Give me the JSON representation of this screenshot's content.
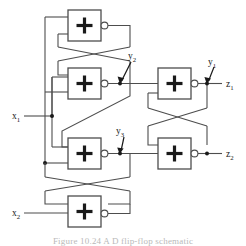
{
  "figure": {
    "type": "logic-circuit-diagram",
    "caption": "Figure 10.24   A D flip-flop schematic",
    "background_color": "#ffffff",
    "wire_color": "#4d4d4d",
    "ink_color": "#1a1a1a"
  },
  "gates": [
    {
      "id": "gate-top-left",
      "symbol": "+",
      "x": 68,
      "y": 10,
      "w": 33,
      "h": 31,
      "inverted_output": true
    },
    {
      "id": "gate-upper-mid-left",
      "symbol": "+",
      "x": 68,
      "y": 68,
      "w": 33,
      "h": 31,
      "inverted_output": true
    },
    {
      "id": "gate-lower-mid-left",
      "symbol": "+",
      "x": 68,
      "y": 138,
      "w": 33,
      "h": 31,
      "inverted_output": true
    },
    {
      "id": "gate-bottom-left",
      "symbol": "+",
      "x": 68,
      "y": 196,
      "w": 33,
      "h": 31,
      "inverted_output": true
    },
    {
      "id": "gate-top-right",
      "symbol": "+",
      "x": 158,
      "y": 68,
      "w": 33,
      "h": 31,
      "inverted_output": true
    },
    {
      "id": "gate-bottom-right",
      "symbol": "+",
      "x": 158,
      "y": 138,
      "w": 33,
      "h": 31,
      "inverted_output": true
    }
  ],
  "signals": {
    "inputs": [
      {
        "id": "x1",
        "base": "x",
        "sub": "1",
        "label_x": 12,
        "label_y": 119,
        "wire_y": 116
      },
      {
        "id": "x2",
        "base": "x",
        "sub": "2",
        "label_x": 12,
        "label_y": 216,
        "wire_y": 213
      }
    ],
    "outputs": [
      {
        "id": "z1",
        "base": "z",
        "sub": "1",
        "label_x": 226,
        "label_y": 87,
        "wire_y": 84
      },
      {
        "id": "z2",
        "base": "z",
        "sub": "2",
        "label_x": 226,
        "label_y": 157,
        "wire_y": 154
      }
    ],
    "internal": [
      {
        "id": "y1",
        "base": "y",
        "sub": "1",
        "label_x": 208,
        "label_y": 65,
        "node_x": 207,
        "node_y": 84
      },
      {
        "id": "y2",
        "base": "y",
        "sub": "2",
        "label_x": 127,
        "label_y": 59,
        "node_x": 120,
        "node_y": 84
      },
      {
        "id": "y3",
        "base": "y",
        "sub": "3",
        "label_x": 116,
        "label_y": 133,
        "node_x": 120,
        "node_y": 154
      }
    ]
  },
  "nodes": [
    {
      "id": "junction-x1-bus",
      "x": 52,
      "y": 116
    },
    {
      "id": "junction-left-bus-lower",
      "x": 45,
      "y": 163
    },
    {
      "id": "junction-y2",
      "x": 120,
      "y": 84
    },
    {
      "id": "junction-y3",
      "x": 120,
      "y": 154
    },
    {
      "id": "junction-z1",
      "x": 207,
      "y": 84
    },
    {
      "id": "junction-z2",
      "x": 207,
      "y": 154
    }
  ]
}
